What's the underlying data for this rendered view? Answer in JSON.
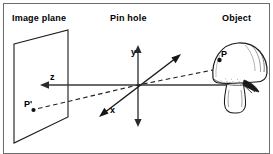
{
  "figure": {
    "width": 273,
    "height": 154,
    "background_color": "#ffffff",
    "line_color": "#1a1a1a",
    "border_color": "#555555"
  },
  "headings": {
    "image_plane": "Image plane",
    "pin_hole": "Pin hole",
    "object": "Object"
  },
  "axes": {
    "y": "y",
    "z": "z",
    "x": "x"
  },
  "points": {
    "p": "P",
    "p_prime": "P'"
  },
  "icons": {
    "mushroom": "mushroom-icon",
    "image_plane": "image-plane-icon",
    "arrow_y": "arrow-up-icon",
    "arrow_z": "arrow-left-icon",
    "arrow_x": "arrow-diagonal-icon",
    "projection_ray": "dashed-ray-icon"
  }
}
